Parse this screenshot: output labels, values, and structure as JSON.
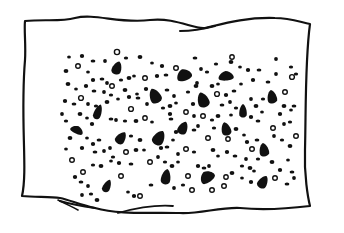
{
  "illustration": {
    "subject": "spotted cloth",
    "ink_color": "#111111",
    "paper_color": "#ffffff",
    "outline": {
      "path": "M25,21 C45,19 60,22 75,18 C95,13 120,24 150,20 C175,17 195,30 205,28 C222,24 245,17 275,18 C290,18 300,22 310,24 C305,60 306,110 305,150 C304,175 308,198 310,206 C285,209 260,210 240,208 C220,207 200,214 180,213 C150,212 120,215 95,208 C80,205 70,200 60,198 C50,197 35,197 22,196 C28,170 20,120 25,60 C26,45 24,30 25,21 Z",
      "stroke_width": 2.2
    },
    "folds": [
      {
        "path": "M215,26 C200,30 190,31 180,31",
        "stroke_width": 2
      },
      {
        "path": "M60,201 C70,204 80,206 95,208",
        "stroke_width": 2
      },
      {
        "path": "M58,200 C70,206 75,208 78,210",
        "stroke_width": 1.6
      },
      {
        "path": "M173,206 C160,205 140,207 118,213",
        "stroke_width": 1.8
      }
    ],
    "blobs": [
      {
        "cx": 117,
        "cy": 68,
        "rx": 5,
        "ry": 7,
        "rot": 20
      },
      {
        "cx": 184,
        "cy": 75,
        "rx": 8,
        "ry": 6,
        "rot": -20
      },
      {
        "cx": 226,
        "cy": 76,
        "rx": 8,
        "ry": 5,
        "rot": -5
      },
      {
        "cx": 155,
        "cy": 96,
        "rx": 6,
        "ry": 8,
        "rot": -25
      },
      {
        "cx": 203,
        "cy": 100,
        "rx": 6,
        "ry": 8,
        "rot": -20
      },
      {
        "cx": 272,
        "cy": 97,
        "rx": 5,
        "ry": 7,
        "rot": -10
      },
      {
        "cx": 98,
        "cy": 112,
        "rx": 4,
        "ry": 8,
        "rot": 20
      },
      {
        "cx": 243,
        "cy": 111,
        "rx": 4,
        "ry": 7,
        "rot": 0
      },
      {
        "cx": 77,
        "cy": 130,
        "rx": 7,
        "ry": 4,
        "rot": 25
      },
      {
        "cx": 121,
        "cy": 138,
        "rx": 5,
        "ry": 7,
        "rot": 35
      },
      {
        "cx": 159,
        "cy": 138,
        "rx": 6,
        "ry": 8,
        "rot": 30
      },
      {
        "cx": 183,
        "cy": 128,
        "rx": 5,
        "ry": 7,
        "rot": 25
      },
      {
        "cx": 226,
        "cy": 129,
        "rx": 5,
        "ry": 7,
        "rot": -15
      },
      {
        "cx": 264,
        "cy": 150,
        "rx": 5,
        "ry": 7,
        "rot": -10
      },
      {
        "cx": 166,
        "cy": 177,
        "rx": 5,
        "ry": 8,
        "rot": 10
      },
      {
        "cx": 207,
        "cy": 177,
        "rx": 8,
        "ry": 6,
        "rot": -35
      },
      {
        "cx": 107,
        "cy": 186,
        "rx": 4,
        "ry": 7,
        "rot": 25
      },
      {
        "cx": 263,
        "cy": 182,
        "rx": 5,
        "ry": 7,
        "rot": 30
      }
    ],
    "rings": [
      {
        "cx": 117,
        "cy": 52,
        "r": 2.6
      },
      {
        "cx": 78,
        "cy": 66,
        "r": 2.3
      },
      {
        "cx": 176,
        "cy": 68,
        "r": 2.3
      },
      {
        "cx": 292,
        "cy": 77,
        "r": 2.4
      },
      {
        "cx": 145,
        "cy": 78,
        "r": 2.3
      },
      {
        "cx": 112,
        "cy": 86,
        "r": 2.3
      },
      {
        "cx": 81,
        "cy": 98,
        "r": 2.4
      },
      {
        "cx": 217,
        "cy": 94,
        "r": 2.4
      },
      {
        "cx": 285,
        "cy": 92,
        "r": 2.3
      },
      {
        "cx": 131,
        "cy": 109,
        "r": 2.4
      },
      {
        "cx": 186,
        "cy": 112,
        "r": 2.2
      },
      {
        "cx": 203,
        "cy": 116,
        "r": 2.3
      },
      {
        "cx": 145,
        "cy": 118,
        "r": 2.2
      },
      {
        "cx": 273,
        "cy": 128,
        "r": 2.3
      },
      {
        "cx": 208,
        "cy": 138,
        "r": 2.3
      },
      {
        "cx": 72,
        "cy": 160,
        "r": 2.3
      },
      {
        "cx": 126,
        "cy": 152,
        "r": 2.3
      },
      {
        "cx": 186,
        "cy": 149,
        "r": 2.3
      },
      {
        "cx": 252,
        "cy": 149,
        "r": 2.3
      },
      {
        "cx": 150,
        "cy": 162,
        "r": 2.3
      },
      {
        "cx": 83,
        "cy": 172,
        "r": 2.3
      },
      {
        "cx": 121,
        "cy": 176,
        "r": 2.3
      },
      {
        "cx": 188,
        "cy": 176,
        "r": 2.3
      },
      {
        "cx": 226,
        "cy": 177,
        "r": 2.2
      },
      {
        "cx": 275,
        "cy": 178,
        "r": 2.3
      },
      {
        "cx": 140,
        "cy": 196,
        "r": 2.3
      },
      {
        "cx": 192,
        "cy": 190,
        "r": 2.3
      },
      {
        "cx": 212,
        "cy": 190,
        "r": 2.3
      },
      {
        "cx": 224,
        "cy": 186,
        "r": 2.3
      },
      {
        "cx": 228,
        "cy": 139,
        "r": 2.2
      },
      {
        "cx": 232,
        "cy": 57,
        "r": 2.2
      },
      {
        "cx": 296,
        "cy": 136,
        "r": 2.3
      }
    ],
    "dots": [
      [
        69,
        57
      ],
      [
        82,
        56
      ],
      [
        93,
        61
      ],
      [
        105,
        61
      ],
      [
        126,
        58
      ],
      [
        140,
        57
      ],
      [
        152,
        63
      ],
      [
        162,
        66
      ],
      [
        195,
        58
      ],
      [
        201,
        69
      ],
      [
        216,
        64
      ],
      [
        231,
        62
      ],
      [
        240,
        67
      ],
      [
        248,
        70
      ],
      [
        259,
        70
      ],
      [
        276,
        59
      ],
      [
        291,
        67
      ],
      [
        66,
        71
      ],
      [
        88,
        72
      ],
      [
        93,
        80
      ],
      [
        102,
        79
      ],
      [
        107,
        83
      ],
      [
        121,
        80
      ],
      [
        129,
        78
      ],
      [
        134,
        76
      ],
      [
        157,
        76
      ],
      [
        166,
        75
      ],
      [
        197,
        83
      ],
      [
        207,
        72
      ],
      [
        212,
        86
      ],
      [
        241,
        84
      ],
      [
        253,
        80
      ],
      [
        268,
        82
      ],
      [
        276,
        74
      ],
      [
        296,
        74
      ],
      [
        68,
        84
      ],
      [
        76,
        89
      ],
      [
        86,
        86
      ],
      [
        94,
        91
      ],
      [
        104,
        92
      ],
      [
        111,
        95
      ],
      [
        125,
        90
      ],
      [
        137,
        94
      ],
      [
        146,
        89
      ],
      [
        167,
        90
      ],
      [
        174,
        96
      ],
      [
        188,
        92
      ],
      [
        196,
        86
      ],
      [
        218,
        84
      ],
      [
        226,
        95
      ],
      [
        234,
        91
      ],
      [
        251,
        99
      ],
      [
        263,
        99
      ],
      [
        284,
        106
      ],
      [
        291,
        110
      ],
      [
        65,
        101
      ],
      [
        74,
        104
      ],
      [
        88,
        104
      ],
      [
        96,
        106
      ],
      [
        107,
        102
      ],
      [
        118,
        99
      ],
      [
        129,
        97
      ],
      [
        138,
        98
      ],
      [
        147,
        104
      ],
      [
        163,
        108
      ],
      [
        170,
        106
      ],
      [
        176,
        103
      ],
      [
        193,
        104
      ],
      [
        222,
        105
      ],
      [
        230,
        102
      ],
      [
        236,
        108
      ],
      [
        256,
        106
      ],
      [
        262,
        112
      ],
      [
        280,
        114
      ],
      [
        294,
        106
      ],
      [
        62,
        114
      ],
      [
        66,
        121
      ],
      [
        80,
        114
      ],
      [
        87,
        118
      ],
      [
        92,
        124
      ],
      [
        111,
        119
      ],
      [
        116,
        120
      ],
      [
        125,
        121
      ],
      [
        136,
        121
      ],
      [
        152,
        122
      ],
      [
        170,
        114
      ],
      [
        171,
        119
      ],
      [
        194,
        116
      ],
      [
        212,
        120
      ],
      [
        218,
        116
      ],
      [
        231,
        115
      ],
      [
        251,
        117
      ],
      [
        258,
        121
      ],
      [
        284,
        124
      ],
      [
        290,
        122
      ],
      [
        70,
        138
      ],
      [
        87,
        138
      ],
      [
        93,
        144
      ],
      [
        99,
        140
      ],
      [
        110,
        148
      ],
      [
        131,
        136
      ],
      [
        140,
        140
      ],
      [
        173,
        140
      ],
      [
        176,
        132
      ],
      [
        194,
        130
      ],
      [
        198,
        126
      ],
      [
        214,
        128
      ],
      [
        236,
        129
      ],
      [
        244,
        135
      ],
      [
        247,
        142
      ],
      [
        257,
        140
      ],
      [
        274,
        136
      ],
      [
        282,
        140
      ],
      [
        290,
        146
      ],
      [
        66,
        149
      ],
      [
        82,
        148
      ],
      [
        95,
        152
      ],
      [
        104,
        151
      ],
      [
        113,
        157
      ],
      [
        136,
        150
      ],
      [
        144,
        150
      ],
      [
        161,
        148
      ],
      [
        167,
        147
      ],
      [
        178,
        154
      ],
      [
        194,
        152
      ],
      [
        213,
        150
      ],
      [
        218,
        156
      ],
      [
        227,
        152
      ],
      [
        235,
        156
      ],
      [
        246,
        159
      ],
      [
        258,
        159
      ],
      [
        272,
        162
      ],
      [
        288,
        160
      ],
      [
        75,
        177
      ],
      [
        81,
        182
      ],
      [
        88,
        186
      ],
      [
        93,
        165
      ],
      [
        101,
        166
      ],
      [
        111,
        161
      ],
      [
        119,
        163
      ],
      [
        131,
        164
      ],
      [
        158,
        157
      ],
      [
        165,
        162
      ],
      [
        172,
        166
      ],
      [
        178,
        162
      ],
      [
        198,
        166
      ],
      [
        204,
        168
      ],
      [
        209,
        166
      ],
      [
        242,
        166
      ],
      [
        250,
        168
      ],
      [
        254,
        171
      ],
      [
        280,
        170
      ],
      [
        292,
        172
      ],
      [
        82,
        195
      ],
      [
        91,
        194
      ],
      [
        97,
        200
      ],
      [
        128,
        192
      ],
      [
        134,
        196
      ],
      [
        151,
        185
      ],
      [
        174,
        188
      ],
      [
        183,
        185
      ],
      [
        232,
        173
      ],
      [
        242,
        178
      ],
      [
        251,
        182
      ],
      [
        287,
        184
      ],
      [
        294,
        178
      ]
    ]
  }
}
